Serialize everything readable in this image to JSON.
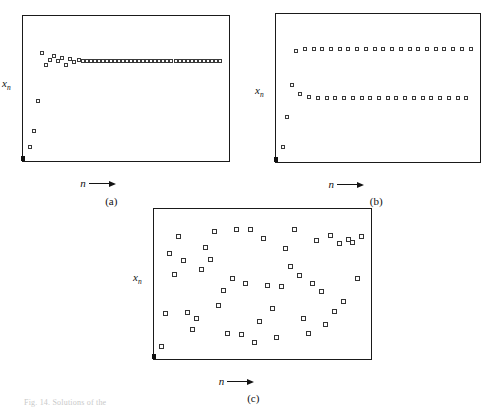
{
  "figure": {
    "background_color": "#ffffff",
    "ink_color": "#1a1a1a",
    "marker_edge_color": "#3a3a3a",
    "bottom_caption": "Fig. 14.  Solutions of the"
  },
  "panels": [
    {
      "id": "a",
      "caption": "(a)",
      "ylabel_main": "x",
      "ylabel_sub": "n",
      "xlabel": "n",
      "frame": {
        "x": 22,
        "y": 15,
        "width": 208,
        "height": 147
      }
    },
    {
      "id": "b",
      "caption": "(b)",
      "ylabel_main": "x",
      "ylabel_sub": "n",
      "xlabel": "n",
      "frame": {
        "x": 275,
        "y": 13,
        "width": 206,
        "height": 150
      }
    },
    {
      "id": "c",
      "caption": "(c)",
      "ylabel_main": "x",
      "ylabel_sub": "n",
      "xlabel": "n",
      "frame": {
        "x": 153,
        "y": 208,
        "width": 219,
        "height": 152
      }
    }
  ],
  "chart_data": [
    {
      "type": "scatter",
      "panel": "a",
      "title": "(a)",
      "xlabel": "n",
      "ylabel": "x_n",
      "grid": false,
      "legend": null,
      "xlim": [
        0,
        48
      ],
      "ylim": [
        0,
        1
      ],
      "description": "Iterates converge monotonically to a stable fixed point after a short transient.",
      "x": [
        0,
        1,
        2,
        3,
        4,
        5,
        6,
        7,
        8,
        9,
        10,
        11,
        12,
        13,
        14,
        15,
        16,
        17,
        18,
        19,
        20,
        21,
        22,
        23,
        24,
        25,
        26,
        27,
        28,
        29,
        30,
        31,
        32,
        33,
        34,
        35,
        36,
        37,
        38,
        39,
        40,
        41,
        42,
        43,
        44,
        45,
        46,
        47
      ],
      "y": [
        0.04,
        0.17,
        0.41,
        0.79,
        0.7,
        0.74,
        0.77,
        0.73,
        0.75,
        0.7,
        0.745,
        0.72,
        0.735,
        0.725,
        0.73,
        0.727,
        0.729,
        0.728,
        0.7285,
        0.7282,
        0.7284,
        0.7283,
        0.7283,
        0.7283,
        0.7283,
        0.7283,
        0.7283,
        0.7283,
        0.7283,
        0.7283,
        0.7283,
        0.7283,
        0.7283,
        0.7283,
        0.7283,
        0.7283,
        0.7283,
        0.7283,
        0.7283,
        0.7283,
        0.7283,
        0.7283,
        0.7283,
        0.7283,
        0.7283,
        0.7283,
        0.7283,
        0.7283
      ]
    },
    {
      "type": "scatter",
      "panel": "b",
      "title": "(b)",
      "xlabel": "n",
      "ylabel": "x_n",
      "grid": false,
      "legend": null,
      "xlim": [
        0,
        44
      ],
      "ylim": [
        0,
        1
      ],
      "description": "Iterates settle into a period-2 cycle alternating between two values.",
      "x": [
        0,
        1,
        2,
        3,
        4,
        5,
        6,
        7,
        8,
        9,
        10,
        11,
        12,
        13,
        14,
        15,
        16,
        17,
        18,
        19,
        20,
        21,
        22,
        23,
        24,
        25,
        26,
        27,
        28,
        29,
        30,
        31,
        32,
        33,
        34,
        35,
        36,
        37,
        38,
        39,
        40,
        41,
        42,
        43
      ],
      "y": [
        0.05,
        0.28,
        0.53,
        0.8,
        0.46,
        0.81,
        0.44,
        0.81,
        0.43,
        0.81,
        0.43,
        0.81,
        0.43,
        0.81,
        0.43,
        0.81,
        0.43,
        0.81,
        0.43,
        0.81,
        0.43,
        0.81,
        0.43,
        0.81,
        0.43,
        0.81,
        0.43,
        0.81,
        0.43,
        0.81,
        0.43,
        0.81,
        0.43,
        0.81,
        0.43,
        0.81,
        0.43,
        0.81,
        0.43,
        0.81,
        0.43,
        0.81,
        0.43,
        0.81
      ]
    },
    {
      "type": "scatter",
      "panel": "c",
      "title": "(c)",
      "xlabel": "n",
      "ylabel": "x_n",
      "grid": false,
      "legend": null,
      "xlim": [
        0,
        46
      ],
      "ylim": [
        0,
        1
      ],
      "description": "Iterates wander irregularly over the whole interval: chaotic behaviour.",
      "x": [
        0,
        1,
        2,
        3,
        4,
        5,
        6,
        7,
        8,
        9,
        10,
        11,
        12,
        13,
        14,
        15,
        16,
        17,
        18,
        19,
        20,
        21,
        22,
        23,
        24,
        25,
        26,
        27,
        28,
        29,
        30,
        31,
        32,
        33,
        34,
        35,
        36,
        37,
        38,
        39,
        40,
        41,
        42,
        43,
        44,
        45
      ],
      "y": [
        0.03,
        0.28,
        0.74,
        0.58,
        0.87,
        0.69,
        0.29,
        0.16,
        0.24,
        0.62,
        0.79,
        0.7,
        0.91,
        0.34,
        0.46,
        0.13,
        0.55,
        0.93,
        0.12,
        0.51,
        0.93,
        0.06,
        0.22,
        0.86,
        0.5,
        0.32,
        0.1,
        0.49,
        0.78,
        0.64,
        0.93,
        0.57,
        0.24,
        0.13,
        0.51,
        0.84,
        0.45,
        0.2,
        0.88,
        0.3,
        0.82,
        0.37,
        0.85,
        0.83,
        0.55,
        0.87
      ]
    }
  ]
}
